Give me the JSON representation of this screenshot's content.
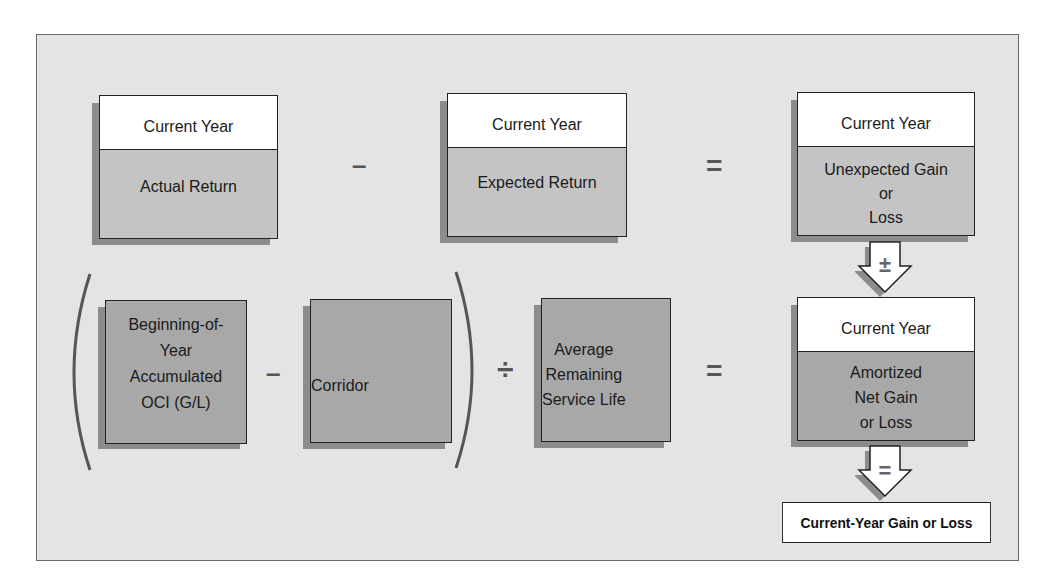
{
  "diagram": {
    "row1": {
      "actual": {
        "header": "Current Year",
        "label": "Actual Return"
      },
      "op1": "–",
      "expected": {
        "header": "Current Year",
        "label": "Expected Return"
      },
      "op2": "=",
      "unexpected": {
        "header": "Current Year",
        "line1": "Unexpected Gain",
        "line2": "or",
        "line3": "Loss"
      }
    },
    "arrow1": {
      "symbol": "±"
    },
    "row2": {
      "beginning": {
        "line1": "Beginning-of-",
        "line2": "Year",
        "line3": "Accumulated",
        "line4": "OCI (G/L)"
      },
      "op1": "–",
      "corridor": {
        "label": "Corridor"
      },
      "op2": "÷",
      "average": {
        "line1": "Average",
        "line2": "Remaining",
        "line3": "Service Life"
      },
      "op3": "=",
      "amortized": {
        "header": "Current Year",
        "line1": "Amortized",
        "line2": "Net Gain",
        "line3": "or Loss"
      }
    },
    "arrow2": {
      "symbol": "="
    },
    "result": {
      "label": "Current-Year Gain or Loss"
    },
    "colors": {
      "background": "#e4e4e4",
      "light_box": "#c4c4c4",
      "dark_box": "#a8a8a8",
      "shadow": "#8c8c8c",
      "border": "#222222"
    }
  }
}
